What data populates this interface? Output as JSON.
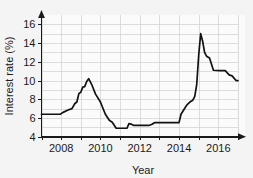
{
  "chart_data": {
    "type": "line",
    "title": "",
    "xlabel": "Year",
    "ylabel": "Interest rate (%)",
    "xlim": [
      2007,
      2017
    ],
    "ylim": [
      4,
      17
    ],
    "grid": true,
    "legend": "none",
    "xticks": [
      2008,
      2010,
      2012,
      2014,
      2016
    ],
    "xtick_labels": [
      "2008",
      "2010",
      "2012",
      "2014",
      "2016"
    ],
    "xticks_minor": [
      2007,
      2009,
      2011,
      2013,
      2015,
      2017
    ],
    "yticks": [
      4,
      6,
      8,
      10,
      12,
      14,
      16
    ],
    "ytick_labels": [
      "4",
      "6",
      "8",
      "10",
      "12",
      "14",
      "16"
    ],
    "series": [
      {
        "name": "Interest rate",
        "color": "#121212",
        "x": [
          2007.0,
          2007.6,
          2007.95,
          2008.1,
          2008.35,
          2008.55,
          2008.7,
          2008.8,
          2008.9,
          2009.0,
          2009.1,
          2009.2,
          2009.3,
          2009.4,
          2009.55,
          2009.75,
          2010.0,
          2010.25,
          2010.45,
          2010.6,
          2010.8,
          2011.05,
          2011.35,
          2011.45,
          2011.55,
          2011.7,
          2012.0,
          2012.45,
          2012.6,
          2012.75,
          2013.3,
          2014.0,
          2014.1,
          2014.25,
          2014.4,
          2014.55,
          2014.7,
          2014.8,
          2014.9,
          2015.0,
          2015.1,
          2015.2,
          2015.3,
          2015.4,
          2015.55,
          2015.75,
          2016.05,
          2016.35,
          2016.55,
          2016.7,
          2016.9,
          2017.0
        ],
        "y": [
          6.4,
          6.4,
          6.4,
          6.6,
          6.85,
          7.0,
          7.55,
          7.7,
          8.6,
          8.75,
          9.3,
          9.35,
          9.9,
          10.2,
          9.6,
          8.55,
          7.7,
          6.4,
          5.75,
          5.55,
          4.9,
          4.9,
          4.9,
          5.4,
          5.35,
          5.2,
          5.2,
          5.2,
          5.3,
          5.5,
          5.5,
          5.5,
          6.4,
          6.9,
          7.4,
          7.7,
          7.9,
          8.3,
          9.6,
          12.7,
          15.0,
          14.2,
          13.0,
          12.6,
          12.4,
          11.1,
          11.05,
          11.05,
          10.6,
          10.5,
          10.0,
          10.0
        ]
      }
    ]
  },
  "axes": {
    "y_axis_name": "interest-rate-axis",
    "x_axis_name": "year-axis"
  },
  "colors": {
    "background": "#f4f4f4",
    "plot_background": "#fbfbfb",
    "grid": "#cfcfcf",
    "axis": "#1a1a1a",
    "line": "#121212"
  }
}
